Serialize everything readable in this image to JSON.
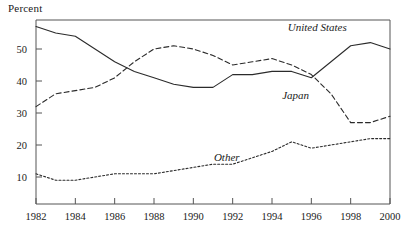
{
  "chart_data": {
    "type": "line",
    "title": "",
    "ylabel": "Percent",
    "xlabel": "",
    "xlim": [
      1982,
      2000
    ],
    "ylim": [
      0,
      58
    ],
    "grid": false,
    "legend_position": "inline-annotations",
    "x": [
      1982,
      1983,
      1984,
      1985,
      1986,
      1987,
      1988,
      1989,
      1990,
      1991,
      1992,
      1993,
      1994,
      1995,
      1996,
      1997,
      1998,
      1999,
      2000
    ],
    "xticks": [
      1982,
      1984,
      1986,
      1988,
      1990,
      1992,
      1994,
      1996,
      1998,
      2000
    ],
    "xtick_labels": [
      "1982",
      "1984",
      "1986",
      "1988",
      "1990",
      "1992",
      "1994",
      "1996",
      "1998",
      "2000"
    ],
    "yticks": [
      10,
      20,
      30,
      40,
      50
    ],
    "ytick_labels": [
      "10",
      "20",
      "30",
      "40",
      "50"
    ],
    "series": [
      {
        "name": "United States",
        "style": "solid",
        "values": [
          57,
          55,
          54,
          50,
          46,
          43,
          41,
          39,
          38,
          38,
          42,
          42,
          43,
          43,
          41,
          46,
          51,
          52,
          50
        ]
      },
      {
        "name": "Japan",
        "style": "dashed",
        "values": [
          32,
          36,
          37,
          38,
          41,
          46,
          50,
          51,
          50,
          48,
          45,
          46,
          47,
          45,
          42,
          36,
          27,
          27,
          29
        ]
      },
      {
        "name": "Other",
        "style": "dotted",
        "values": [
          11,
          9,
          9,
          10,
          11,
          11,
          11,
          12,
          13,
          14,
          14,
          16,
          18,
          21,
          19,
          20,
          21,
          22,
          22
        ]
      }
    ],
    "annotations": [
      {
        "text": "United States",
        "x": 1996.3,
        "y": 55.5
      },
      {
        "text": "Japan",
        "x": 1995.2,
        "y": 34.5
      },
      {
        "text": "Other",
        "x": 1991.7,
        "y": 15.0
      }
    ]
  }
}
